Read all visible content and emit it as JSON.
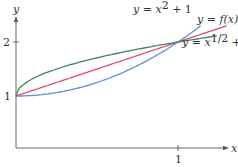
{
  "chart_data": {
    "type": "line",
    "title": "",
    "xlabel": "x",
    "ylabel": "y",
    "xlim": [
      0,
      1.3
    ],
    "ylim": [
      0,
      2.4
    ],
    "x_ticks": [
      {
        "value": 1,
        "label": "1"
      }
    ],
    "y_ticks": [
      {
        "value": 1,
        "label": "1"
      },
      {
        "value": 2,
        "label": "2"
      }
    ],
    "grid": false,
    "legend": "inline annotations",
    "series": [
      {
        "name": "y = x^2 + 1",
        "label_prefix": "y = x",
        "label_sup": "2",
        "label_suffix": " + 1",
        "color": "#5b8fd6",
        "formula": "x^2+1",
        "x_range": [
          0,
          1.14
        ]
      },
      {
        "name": "y = f(x)",
        "label_text": "y = f(x)",
        "color": "#e0457b",
        "formula": "x+1",
        "x_range": [
          0,
          1.3
        ]
      },
      {
        "name": "y = x^{1/2} + 1",
        "label_prefix": "y = x",
        "label_sup": "1/2",
        "label_suffix": " + 1",
        "color": "#3a8a5c",
        "formula": "sqrt(x)+1",
        "x_range": [
          0,
          1.24
        ]
      }
    ],
    "annotations": [
      {
        "text": "y = x^2 + 1",
        "near_x": 1.0,
        "near_y": 2.3
      },
      {
        "text": "y = f(x)",
        "near_x": 1.3,
        "near_y": 2.25
      },
      {
        "text": "y = x^{1/2} + 1",
        "near_x": 1.25,
        "near_y": 1.85
      }
    ]
  },
  "axes": {
    "x_label": "x",
    "y_label": "y",
    "x_tick_1": "1",
    "y_tick_1": "1",
    "y_tick_2": "2"
  },
  "labels": {
    "parabola": {
      "prefix": "y = x",
      "sup": "2",
      "suffix": " + 1"
    },
    "line": {
      "text": "y = f(x)"
    },
    "sqrt": {
      "prefix": "y = x",
      "sup": "1/2",
      "suffix": " + 1"
    }
  }
}
